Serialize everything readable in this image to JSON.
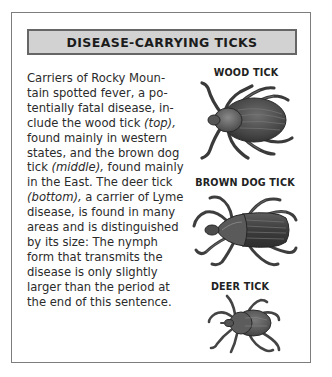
{
  "header": {
    "title": "DISEASE-CARRYING TICKS"
  },
  "body": {
    "lines": [
      {
        "pre": "Carriers of Rocky Moun-",
        "em": "",
        "post": ""
      },
      {
        "pre": "tain spotted fever, a po-",
        "em": "",
        "post": ""
      },
      {
        "pre": "tentially fatal disease, in-",
        "em": "",
        "post": ""
      },
      {
        "pre": "clude the wood tick ",
        "em": "(top),",
        "post": ""
      },
      {
        "pre": "found mainly in western",
        "em": "",
        "post": ""
      },
      {
        "pre": "states, and the brown dog",
        "em": "",
        "post": ""
      },
      {
        "pre": "tick ",
        "em": "(middle),",
        "post": " found mainly"
      },
      {
        "pre": "in the East. The deer tick",
        "em": "",
        "post": ""
      },
      {
        "pre": "",
        "em": "(bottom),",
        "post": " a carrier of Lyme"
      },
      {
        "pre": "disease, is found in many",
        "em": "",
        "post": ""
      },
      {
        "pre": "areas and is distinguished",
        "em": "",
        "post": ""
      },
      {
        "pre": "by its size: The nymph",
        "em": "",
        "post": ""
      },
      {
        "pre": "form that transmits the",
        "em": "",
        "post": ""
      },
      {
        "pre": "disease is only slightly",
        "em": "",
        "post": ""
      },
      {
        "pre": "larger than the period at",
        "em": "",
        "post": ""
      },
      {
        "pre": "the end of this sentence.",
        "em": "",
        "post": ""
      }
    ]
  },
  "ticks": [
    {
      "label": "WOOD TICK",
      "position": "top"
    },
    {
      "label": "BROWN DOG TICK",
      "position": "middle"
    },
    {
      "label": "DEER TICK",
      "position": "bottom"
    }
  ],
  "colors": {
    "frame_border": "#7d7d7d",
    "header_fill": "#d2d2d2",
    "header_border": "#666666",
    "tick_body": "#4a4a4a"
  }
}
